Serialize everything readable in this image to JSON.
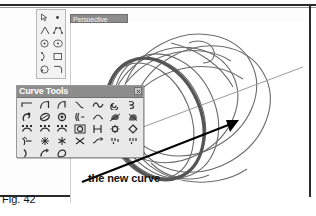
{
  "figure": {
    "caption": "Fig. 42"
  },
  "viewport": {
    "title": "Perspective",
    "background_color": "#ffffff",
    "title_bar_color": "#8d8d8d"
  },
  "main_toolbar": {
    "name": "main-toolbar",
    "columns": 2,
    "rows": 5,
    "buttons": [
      {
        "name": "select-arrow-icon",
        "label": "Select"
      },
      {
        "name": "point-icon",
        "label": "Point"
      },
      {
        "name": "polyline-icon",
        "label": "Polyline"
      },
      {
        "name": "control-point-curve-icon",
        "label": "Control Point Curve"
      },
      {
        "name": "circle-center-icon",
        "label": "Circle: center, radius"
      },
      {
        "name": "ellipse-icon",
        "label": "Ellipse"
      },
      {
        "name": "arc-icon",
        "label": "Arc"
      },
      {
        "name": "rectangle-icon",
        "label": "Rectangle"
      },
      {
        "name": "circle-diameter-icon",
        "label": "Circle: diameter"
      },
      {
        "name": "curve-fillet-icon",
        "label": "Fillet curves"
      }
    ]
  },
  "curve_tools": {
    "title": "Curve Tools",
    "close_button_label": "Close",
    "columns": 7,
    "rows": 5,
    "buttons": [
      {
        "name": "line-icon",
        "label": "Line"
      },
      {
        "name": "polyline-icon",
        "label": "Polyline"
      },
      {
        "name": "polyline-segment-icon",
        "label": "Polyline segment"
      },
      {
        "name": "curve-through-points-icon",
        "label": "Curve through points"
      },
      {
        "name": "curve-wave-icon",
        "label": "Interpolated curve"
      },
      {
        "name": "spiral-icon",
        "label": "Spiral"
      },
      {
        "name": "helix-icon",
        "label": "Helix"
      },
      {
        "name": "sketch-curve-icon",
        "label": "Sketch curve"
      },
      {
        "name": "conic-icon",
        "label": "Conic"
      },
      {
        "name": "circle-point-icon",
        "label": "Circle around point"
      },
      {
        "name": "curve-edit-icon",
        "label": "Edit curve"
      },
      {
        "name": "curve-blend-icon",
        "label": "Blend curves"
      },
      {
        "name": "curve-from-object-icon",
        "label": "Curve from object"
      },
      {
        "name": "curve-project-icon",
        "label": "Project curve"
      },
      {
        "name": "fit-curve-icon",
        "label": "Fit curve"
      },
      {
        "name": "rebuild-curve-icon",
        "label": "Rebuild curve"
      },
      {
        "name": "refit-curve-icon",
        "label": "Refit curve"
      },
      {
        "name": "curve-boolean-icon",
        "label": "Curve boolean"
      },
      {
        "name": "offset-curve-icon",
        "label": "Offset curve"
      },
      {
        "name": "curve-radial-icon",
        "label": "Radial array curve"
      },
      {
        "name": "curve-diamond-icon",
        "label": "Diamond curve"
      },
      {
        "name": "extend-curve-icon",
        "label": "Extend curve"
      },
      {
        "name": "curve-node-icon",
        "label": "Insert knot"
      },
      {
        "name": "curve-split-icon",
        "label": "Split curve"
      },
      {
        "name": "curve-trim-icon",
        "label": "Trim curve"
      },
      {
        "name": "curve-join-icon",
        "label": "Join curves"
      },
      {
        "name": "curve-match-icon",
        "label": "Match curve"
      },
      {
        "name": "curve-simplify-icon",
        "label": "Simplify curve"
      },
      {
        "name": "curve-tangent-icon",
        "label": "Tangent curve"
      },
      {
        "name": "curve-arc-blend-icon",
        "label": "Arc blend"
      },
      {
        "name": "curve-planar-icon",
        "label": "Planar curve"
      }
    ]
  },
  "annotation": {
    "callout_text": "the new curve",
    "arrow_color": "#000000",
    "highlight_curve_color": "#555555"
  },
  "model": {
    "description": "Wireframe ring / band surface shown in perspective",
    "highlight_curve_name": "new-curve",
    "axis_line_color": "#9b9b9b",
    "wireframe_color": "#6b6b6b"
  }
}
